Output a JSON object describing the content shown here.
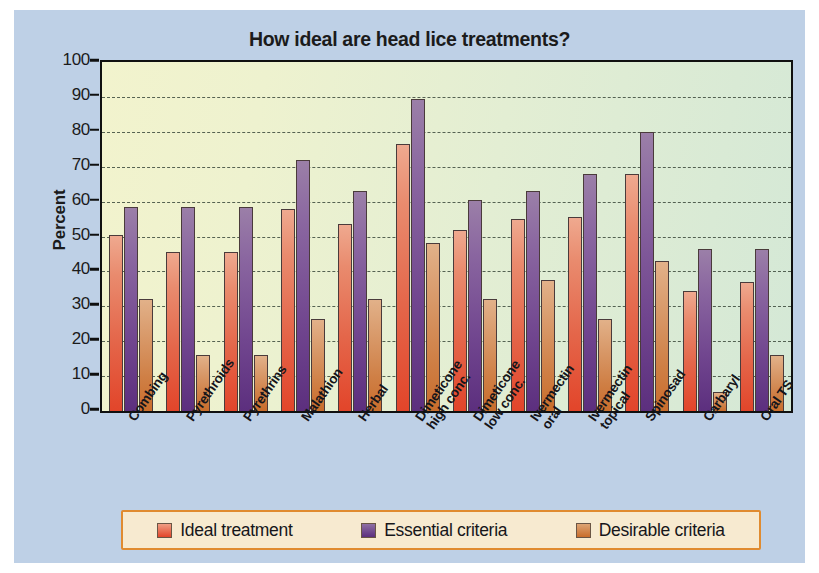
{
  "figure": {
    "panel_color": "#bed0e6",
    "plot_bg_left": "#f2f3cd",
    "plot_bg_right": "#d4e8d6"
  },
  "chart_data": {
    "type": "bar",
    "title": "How ideal are head lice treatments?",
    "xlabel": "",
    "ylabel": "Percent",
    "ylim": [
      0,
      100
    ],
    "ytick_step": 10,
    "yticks": [
      100,
      90,
      80,
      70,
      60,
      50,
      40,
      30,
      20,
      10,
      0
    ],
    "grid": true,
    "legend_position": "bottom",
    "categories": [
      "Combing",
      "Pyrethroids",
      "Pyrethrins",
      "Malathion",
      "Herbal",
      "Dimeticone\nhigh conc.",
      "Dimeticone\nlow conc.",
      "Ivermectin\noral",
      "Ivermectin\ntopical",
      "Spinosad",
      "Carbaryl",
      "Oral TS"
    ],
    "series": [
      {
        "name": "Ideal treatment",
        "color": "#e2452a",
        "values": [
          50.5,
          45.5,
          45.5,
          58,
          53.5,
          76.5,
          52,
          55,
          55.5,
          68,
          34.5,
          37
        ]
      },
      {
        "name": "Essential criteria",
        "color": "#5c2f7e",
        "values": [
          58.5,
          58.5,
          58.5,
          72,
          63,
          89.5,
          60.5,
          63,
          68,
          80,
          46.5,
          46.5
        ]
      },
      {
        "name": "Desirable criteria",
        "color": "#c96d2c",
        "values": [
          32,
          16,
          16,
          26.5,
          32,
          48,
          32,
          37.5,
          26.5,
          43,
          5.5,
          16
        ]
      }
    ]
  },
  "legend": {
    "items": [
      {
        "label": "Ideal treatment"
      },
      {
        "label": "Essential criteria"
      },
      {
        "label": "Desirable criteria"
      }
    ]
  }
}
